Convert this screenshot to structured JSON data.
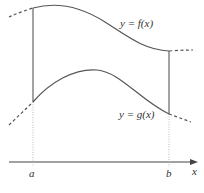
{
  "diagram": {
    "curve_upper_label": "y = f(x)",
    "curve_lower_label": "y = g(x)",
    "axis_label": "x",
    "left_bound_label": "a",
    "right_bound_label": "b",
    "colors": {
      "curve": "#555555",
      "dashed": "#555555",
      "axis": "#444444",
      "guide": "#999999",
      "text": "#333333"
    }
  }
}
